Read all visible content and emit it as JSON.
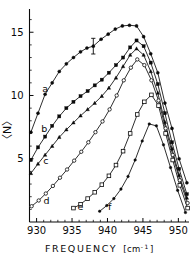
{
  "figure": {
    "title": "",
    "background_color": "#ffffff",
    "ink_color": "#0a0a0a"
  },
  "axes": {
    "x_title_main": "FREQUENCY",
    "x_title_unit_open": "[cm",
    "x_title_unit_sup": "-1",
    "x_title_unit_close": "]",
    "y_title": "〈N〉",
    "x_ticks": [
      "930",
      "935",
      "940",
      "945",
      "950"
    ],
    "y_ticks": [
      "5",
      "10",
      "15"
    ]
  },
  "curve_labels": {
    "a": "a",
    "b": "b",
    "c": "c",
    "d": "d",
    "e": "e",
    "f": "f"
  },
  "chart_data": {
    "type": "line",
    "title": "",
    "xlabel": "FREQUENCY [cm-1]",
    "ylabel": "<N>",
    "xlim": [
      929,
      951.5
    ],
    "ylim": [
      0,
      16.6
    ],
    "xticks": [
      930,
      935,
      940,
      945,
      950
    ],
    "yticks": [
      5,
      10,
      15
    ],
    "grid": false,
    "legend": "inline-curve-labels",
    "annotations": [
      {
        "type": "errorbar",
        "series": "a",
        "x": 938.0,
        "y": 13.9,
        "yerr": 0.62
      }
    ],
    "series": [
      {
        "name": "a",
        "label": "a",
        "marker": "filled-circle",
        "label_position": {
          "x": 931.2,
          "y": 10.3
        },
        "x": [
          929.2,
          930.2,
          931.2,
          932.2,
          933.2,
          934.2,
          935.2,
          936.2,
          937.1,
          938.0,
          939.1,
          940.1,
          941.1,
          942.1,
          943.1,
          944.1,
          945.1,
          946.1,
          947.1,
          948.1,
          949.1,
          950.1,
          951.2
        ],
        "y": [
          7.1,
          8.6,
          10.1,
          11.0,
          11.9,
          12.5,
          13.0,
          13.45,
          13.75,
          13.9,
          14.45,
          14.85,
          15.25,
          15.5,
          15.55,
          15.5,
          14.65,
          13.3,
          11.8,
          9.4,
          7.4,
          5.0,
          3.1
        ]
      },
      {
        "name": "b",
        "label": "b",
        "marker": "filled-square",
        "label_position": {
          "x": 931.1,
          "y": 7.1
        },
        "x": [
          929.2,
          930.2,
          931.2,
          932.2,
          933.2,
          934.2,
          935.2,
          936.2,
          937.2,
          938.2,
          939.2,
          940.2,
          941.2,
          942.2,
          943.2,
          944.1,
          945.1,
          946.1,
          947.1,
          948.1,
          949.1,
          950.1,
          951.2
        ],
        "y": [
          4.9,
          5.9,
          6.75,
          7.6,
          8.35,
          9.0,
          9.5,
          9.95,
          10.35,
          10.8,
          11.25,
          11.8,
          12.4,
          13.0,
          13.8,
          14.35,
          13.9,
          12.6,
          10.9,
          8.6,
          6.3,
          4.2,
          2.2
        ]
      },
      {
        "name": "c",
        "label": "c",
        "marker": "filled-triangle",
        "label_position": {
          "x": 931.3,
          "y": 4.55
        },
        "x": [
          929.2,
          930.2,
          931.2,
          932.2,
          933.2,
          934.2,
          935.2,
          936.2,
          937.2,
          938.2,
          939.2,
          940.2,
          941.2,
          942.2,
          943.2,
          944.1,
          945.1,
          946.1,
          947.1,
          948.1,
          949.1,
          950.1,
          951.2
        ],
        "y": [
          3.85,
          4.6,
          5.3,
          6.0,
          6.7,
          7.3,
          7.85,
          8.4,
          8.9,
          9.4,
          9.95,
          10.6,
          11.4,
          12.3,
          13.2,
          13.7,
          13.2,
          11.9,
          10.2,
          7.9,
          5.8,
          3.7,
          1.9
        ]
      },
      {
        "name": "d",
        "label": "d",
        "marker": "open-circle",
        "label_position": {
          "x": 931.4,
          "y": 1.45
        },
        "x": [
          929.3,
          930.3,
          931.3,
          932.3,
          933.3,
          934.3,
          935.3,
          936.3,
          937.3,
          938.3,
          939.3,
          940.3,
          941.3,
          942.3,
          943.3,
          944.2,
          945.2,
          946.2,
          947.2,
          948.2,
          949.2,
          950.2,
          951.3
        ],
        "y": [
          1.25,
          1.7,
          2.25,
          2.85,
          3.5,
          4.15,
          4.85,
          5.55,
          6.3,
          7.1,
          7.95,
          8.9,
          10.0,
          11.2,
          12.2,
          12.85,
          12.4,
          11.2,
          9.6,
          7.4,
          5.3,
          3.3,
          1.5
        ]
      },
      {
        "name": "e",
        "label": "e",
        "marker": "open-square",
        "label_position": {
          "x": 936.2,
          "y": 0.95
        },
        "x": [
          935.2,
          936.2,
          937.2,
          938.2,
          939.2,
          940.2,
          941.2,
          942.2,
          943.2,
          944.2,
          945.2,
          946.2,
          947.2,
          948.2,
          949.2,
          950.2,
          951.3
        ],
        "y": [
          1.1,
          1.4,
          1.85,
          2.35,
          2.95,
          3.65,
          4.5,
          5.6,
          7.0,
          8.5,
          9.5,
          10.05,
          9.2,
          7.0,
          4.9,
          2.9,
          1.1
        ]
      },
      {
        "name": "f",
        "label": "f",
        "marker": "filled-circle-small",
        "label_position": {
          "x": 940.3,
          "y": 0.95
        },
        "x": [
          938.9,
          939.9,
          940.9,
          941.9,
          942.9,
          943.9,
          944.9,
          945.9,
          946.9,
          947.9,
          948.9,
          949.9,
          951.0
        ],
        "y": [
          0.85,
          1.3,
          1.85,
          2.6,
          3.6,
          4.9,
          6.4,
          7.75,
          7.6,
          6.1,
          4.3,
          2.5,
          0.75
        ]
      }
    ]
  }
}
